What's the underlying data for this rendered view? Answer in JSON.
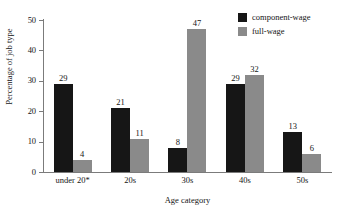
{
  "chart_data": {
    "type": "bar",
    "title": "",
    "xlabel": "Age category",
    "ylabel": "Percentage of job type",
    "categories": [
      "under 20*",
      "20s",
      "30s",
      "40s",
      "50s"
    ],
    "series": [
      {
        "name": "component-wage",
        "color": "#161616",
        "values": [
          29,
          21,
          8,
          29,
          13
        ]
      },
      {
        "name": "full-wage",
        "color": "#8a8a8a",
        "values": [
          4,
          11,
          47,
          32,
          6
        ]
      }
    ],
    "ylim": [
      0,
      50
    ],
    "yticks": [
      0,
      10,
      20,
      30,
      40,
      50
    ],
    "ytick_labels": [
      "0",
      "10",
      "20",
      "30",
      "40",
      "50"
    ],
    "grid": false,
    "legend_position": "top-right",
    "data_labels": true
  },
  "legend": {
    "items": [
      {
        "label": "component-wage",
        "swatch": "component"
      },
      {
        "label": "full-wage",
        "swatch": "full"
      }
    ]
  },
  "axes": {
    "y_title": "Percentage of job type",
    "x_title": "Age category",
    "y_ticks": [
      "50",
      "40",
      "30",
      "20",
      "10",
      "0"
    ]
  }
}
